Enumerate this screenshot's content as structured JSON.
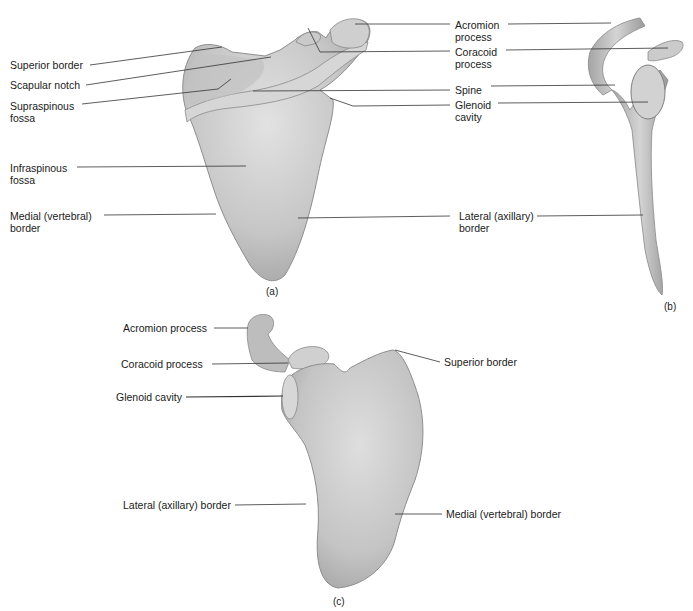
{
  "figure": {
    "panels": [
      {
        "id": "a",
        "caption": "(a)",
        "labels": [
          {
            "key": "superior_border",
            "text": "Superior border"
          },
          {
            "key": "scapular_notch",
            "text": "Scapular notch"
          },
          {
            "key": "supraspinous_fossa",
            "text": "Supraspinous\nfossa"
          },
          {
            "key": "infraspinous_fossa",
            "text": "Infraspinous\nfossa"
          },
          {
            "key": "medial_border",
            "text": "Medial (vertebral)\nborder"
          },
          {
            "key": "acromion_process",
            "text": "Acromion\nprocess"
          },
          {
            "key": "coracoid_process",
            "text": "Coracoid\nprocess"
          },
          {
            "key": "spine",
            "text": "Spine"
          },
          {
            "key": "glenoid_cavity",
            "text": "Glenoid\ncavity"
          },
          {
            "key": "lateral_border",
            "text": "Lateral (axillary)\nborder"
          }
        ]
      },
      {
        "id": "b",
        "caption": "(b)",
        "labels": []
      },
      {
        "id": "c",
        "caption": "(c)",
        "labels": [
          {
            "key": "acromion_process",
            "text": "Acromion process"
          },
          {
            "key": "coracoid_process",
            "text": "Coracoid process"
          },
          {
            "key": "glenoid_cavity",
            "text": "Glenoid cavity"
          },
          {
            "key": "lateral_border",
            "text": "Lateral (axillary) border"
          },
          {
            "key": "superior_border",
            "text": "Superior border"
          },
          {
            "key": "medial_border",
            "text": "Medial (vertebral) border"
          }
        ]
      }
    ],
    "colors": {
      "bone_fill": "#c9c9c9",
      "bone_shadow": "#9a9a9a",
      "bone_highlight": "#e4e4e4",
      "leader_line": "#333333",
      "text": "#1a1a1a"
    }
  }
}
